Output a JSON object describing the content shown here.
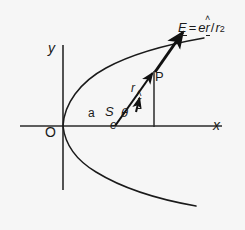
{
  "figure": {
    "background_color": "#f6f6f6",
    "ink_color": "#1a1a1a",
    "axes": {
      "x_label": "x",
      "y_label": "y",
      "origin_label": "O"
    },
    "points": {
      "focus_label": "S",
      "charge_label": "e",
      "field_point_label": "P"
    },
    "lengths": {
      "semi_latus_label": "a",
      "radius_label": "r",
      "angle_label": "θ"
    },
    "unit_vector": {
      "symbol": "r",
      "hat": "˄"
    },
    "formula": {
      "field_symbol": "E",
      "equals": "=",
      "charge": "e",
      "unit_vector_symbol": "r",
      "unit_vector_hat": "˄",
      "divide": "/",
      "denominator_symbol": "r",
      "denominator_exponent": "2",
      "plain_text": "E = e r̂ / r²"
    }
  }
}
